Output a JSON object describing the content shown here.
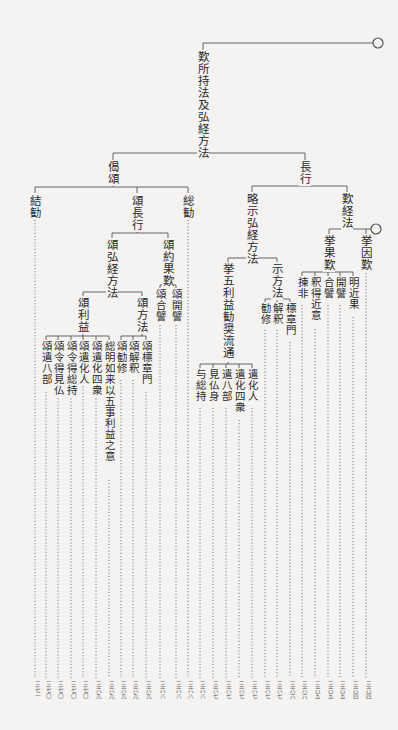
{
  "root": {
    "label": "歎所持法及弘経方法"
  },
  "branches": {
    "geju": {
      "label": "偈頌"
    },
    "chogyo": {
      "label": "長行"
    },
    "ketsukan": {
      "label": "結勧"
    },
    "ju_chogyo": {
      "label": "頌長行"
    },
    "sokan": {
      "label": "総勧"
    },
    "ju_gukyo": {
      "label": "頌弘経方法"
    },
    "ju_yakuka": {
      "label": "頌約果歎"
    },
    "ju_riyaku": {
      "label": "頌利益"
    },
    "ju_hoho": {
      "label": "頌方法"
    },
    "ryakuji": {
      "label": "略示弘経方法"
    },
    "tangyo": {
      "label": "歎経法"
    },
    "kyogoriyaku": {
      "label": "挙五利益勧奨流通"
    },
    "jihoho": {
      "label": "示方法"
    },
    "kyokatan": {
      "label": "挙果歎"
    },
    "kyointan": {
      "label": "挙因歎"
    }
  },
  "leaves": [
    {
      "label": "結勧",
      "ref": "三七一"
    },
    {
      "label": "頌遣八部",
      "ref": "三七〇"
    },
    {
      "label": "頌令得見仏",
      "ref": "三七〇"
    },
    {
      "label": "頌令得総持",
      "ref": "三七〇"
    },
    {
      "label": "頌遣化人",
      "ref": "三七〇"
    },
    {
      "label": "頌遣化四衆",
      "ref": "三六九"
    },
    {
      "label": "総明如来以五事利益之意",
      "ref": "三六九"
    },
    {
      "label": "頌勧修",
      "ref": "三六九"
    },
    {
      "label": "頌解釈",
      "ref": "三六九"
    },
    {
      "label": "頌標章門",
      "ref": "三六九"
    },
    {
      "label": "頌合譬",
      "ref": "三六八"
    },
    {
      "label": "頌開譬",
      "ref": "三六八"
    },
    {
      "label": "総勧",
      "ref": "三六八"
    },
    {
      "label": "与総持",
      "ref": "三六八"
    },
    {
      "label": "見仏身",
      "ref": "三六七"
    },
    {
      "label": "遣八部",
      "ref": "三六七"
    },
    {
      "label": "遣化四衆",
      "ref": "三六七"
    },
    {
      "label": "遣化人",
      "ref": "三六七"
    },
    {
      "label": "勧修",
      "ref": "三六七"
    },
    {
      "label": "解釈",
      "ref": "三六七"
    },
    {
      "label": "標章門",
      "ref": "三六六"
    },
    {
      "label": "揀非",
      "ref": "三六六"
    },
    {
      "label": "釈得近意",
      "ref": "三六五"
    },
    {
      "label": "合譬",
      "ref": "三六五"
    },
    {
      "label": "開譬",
      "ref": "三六五"
    },
    {
      "label": "明近果",
      "ref": "三六四"
    },
    {
      "label": "挙因歎",
      "ref": "三六四"
    }
  ]
}
